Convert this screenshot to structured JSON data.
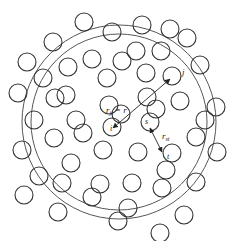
{
  "figure": {
    "colors": {
      "stroke": "#333333",
      "background": "#ffffff"
    },
    "labels": {
      "rji_main": "r",
      "rji_sub": "ji",
      "rji_eq": "= r",
      "i": "i",
      "j": "j",
      "s": "s",
      "t": "t",
      "rst_main": "r",
      "rst_sub": "st"
    },
    "shell_note": "Two concentric circles (spherical shell of radius r and r+dr) centered on particle i",
    "particle_count": 56
  }
}
